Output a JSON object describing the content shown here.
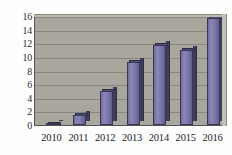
{
  "chart_data": {
    "type": "bar",
    "title": "",
    "subtitle": "",
    "xlabel": "",
    "ylabel": "",
    "categories": [
      "2010",
      "2011",
      "2012",
      "2013",
      "2014",
      "2015",
      "2016"
    ],
    "values": [
      0.2,
      1.5,
      5.0,
      9.2,
      11.8,
      11.0,
      15.7
    ],
    "series": [
      {
        "name": "",
        "values": [
          0.2,
          1.5,
          5.0,
          9.2,
          11.8,
          11.0,
          15.7
        ]
      }
    ],
    "ylim": [
      0,
      16
    ],
    "yticks": [
      0,
      2,
      4,
      6,
      8,
      10,
      12,
      14,
      16
    ],
    "ytick_labels": [
      "0",
      "2",
      "4",
      "6",
      "8",
      "10",
      "12",
      "14",
      "16"
    ],
    "xtick_labels": [
      "2010",
      "2011",
      "2012",
      "2013",
      "2014",
      "2015",
      "2016"
    ],
    "grid": true,
    "grid_axis": "y",
    "legend": false,
    "legend_position": "none",
    "style": "3d-column",
    "colors": {
      "bar_face": "#7c78aa",
      "bar_side": "#3f3c5c",
      "bar_top": "#524e78",
      "bar_outline": "#3a3754",
      "plot_background": "#a9a69d",
      "plot_depth": "#c3c0b6",
      "gridline": "#83807a",
      "axis": "#55525a",
      "page_background": "#fdfdfc",
      "tick_label": "#23232c"
    }
  }
}
